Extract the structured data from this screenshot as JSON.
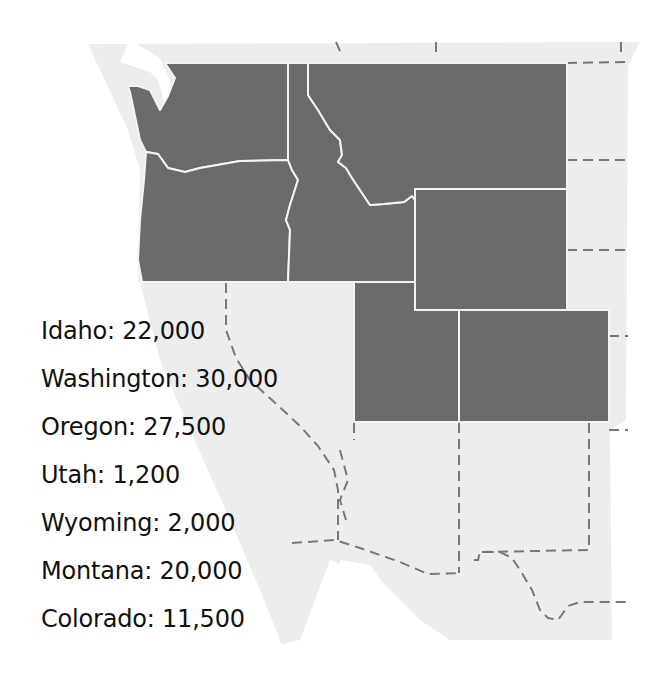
{
  "map": {
    "colors": {
      "background": "#ffffff",
      "land_other": "#ededed",
      "highlighted_states": "#6b6b6b",
      "state_border": "#f4f4f4",
      "dashed_border": "#777777",
      "text": "#111111"
    },
    "highlighted_states": [
      "Washington",
      "Oregon",
      "Idaho",
      "Montana",
      "Wyoming",
      "Utah",
      "Colorado"
    ]
  },
  "legend": {
    "items": [
      {
        "state": "Idaho",
        "value": "22,000",
        "text": "Idaho: 22,000"
      },
      {
        "state": "Washington",
        "value": "30,000",
        "text": "Washington: 30,000"
      },
      {
        "state": "Oregon",
        "value": "27,500",
        "text": "Oregon: 27,500"
      },
      {
        "state": "Utah",
        "value": "1,200",
        "text": "Utah: 1,200"
      },
      {
        "state": "Wyoming",
        "value": "2,000",
        "text": "Wyoming: 2,000"
      },
      {
        "state": "Montana",
        "value": "20,000",
        "text": "Montana: 20,000"
      },
      {
        "state": "Colorado",
        "value": "11,500",
        "text": "Colorado: 11,500"
      }
    ]
  }
}
